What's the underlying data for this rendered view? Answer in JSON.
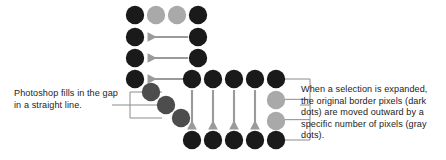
{
  "figure": {
    "name": "photoshop-expand-selection-diagram",
    "colors": {
      "dark_dot": "#1a1a1a",
      "light_gray_dot": "#a9a9a9",
      "mid_gray_dot": "#4d4d4d",
      "arrow": "#9a9a9a",
      "bracket": "#8c8c8c",
      "background": "#ffffff",
      "text": "#1c1c1c"
    }
  },
  "captions": {
    "left": {
      "text": "Photoshop fills in the gap in a straight line.",
      "lines": [
        "Photoshop fills in the",
        "gap in a straight line."
      ]
    },
    "right": {
      "text": "When a selection is expanded, the original border pixels (dark dots) are moved outward by a specific number of pixels (gray dots).",
      "lines": [
        "When a selection is expanded,",
        "the original border pixels",
        "(dark dots) are moved",
        "outward by a specific number",
        "of pixels (gray dots)."
      ]
    }
  },
  "chart_data": {
    "type": "diagram",
    "legend": [
      {
        "name": "original border pixel",
        "color": "#1a1a1a",
        "label": "dark dots"
      },
      {
        "name": "expanded pixel",
        "color": "#a9a9a9",
        "label": "gray dots"
      },
      {
        "name": "gap fill pixel",
        "color": "#4d4d4d",
        "label": "diagonal fill dots"
      }
    ],
    "dot_radius": 9.2,
    "dots": [
      {
        "id": "d1",
        "x": 135,
        "y": 15,
        "color": "#1a1a1a",
        "kind": "dark"
      },
      {
        "id": "d2",
        "x": 156,
        "y": 15,
        "color": "#a9a9a9",
        "kind": "light"
      },
      {
        "id": "d3",
        "x": 177,
        "y": 15,
        "color": "#a9a9a9",
        "kind": "light"
      },
      {
        "id": "d4",
        "x": 198,
        "y": 15,
        "color": "#1a1a1a",
        "kind": "dark"
      },
      {
        "id": "d5",
        "x": 135,
        "y": 37,
        "color": "#1a1a1a",
        "kind": "dark"
      },
      {
        "id": "d6",
        "x": 198,
        "y": 37,
        "color": "#1a1a1a",
        "kind": "dark"
      },
      {
        "id": "d7",
        "x": 135,
        "y": 58,
        "color": "#1a1a1a",
        "kind": "dark"
      },
      {
        "id": "d8",
        "x": 198,
        "y": 58,
        "color": "#1a1a1a",
        "kind": "dark"
      },
      {
        "id": "d9",
        "x": 135,
        "y": 79,
        "color": "#1a1a1a",
        "kind": "dark"
      },
      {
        "id": "g1",
        "x": 151,
        "y": 92,
        "color": "#4d4d4d",
        "kind": "mid"
      },
      {
        "id": "g2",
        "x": 166,
        "y": 105,
        "color": "#4d4d4d",
        "kind": "mid"
      },
      {
        "id": "g3",
        "x": 181,
        "y": 118,
        "color": "#4d4d4d",
        "kind": "mid"
      },
      {
        "id": "r1",
        "x": 192,
        "y": 79,
        "color": "#1a1a1a",
        "kind": "dark"
      },
      {
        "id": "r2",
        "x": 213,
        "y": 79,
        "color": "#1a1a1a",
        "kind": "dark"
      },
      {
        "id": "r3",
        "x": 234,
        "y": 79,
        "color": "#1a1a1a",
        "kind": "dark"
      },
      {
        "id": "r4",
        "x": 255,
        "y": 79,
        "color": "#1a1a1a",
        "kind": "dark"
      },
      {
        "id": "r5",
        "x": 276,
        "y": 79,
        "color": "#1a1a1a",
        "kind": "dark"
      },
      {
        "id": "c1",
        "x": 276,
        "y": 100,
        "color": "#a9a9a9",
        "kind": "light"
      },
      {
        "id": "c2",
        "x": 276,
        "y": 121,
        "color": "#a9a9a9",
        "kind": "light"
      },
      {
        "id": "b1",
        "x": 192,
        "y": 140,
        "color": "#1a1a1a",
        "kind": "dark"
      },
      {
        "id": "b2",
        "x": 213,
        "y": 140,
        "color": "#1a1a1a",
        "kind": "dark"
      },
      {
        "id": "b3",
        "x": 234,
        "y": 140,
        "color": "#1a1a1a",
        "kind": "dark"
      },
      {
        "id": "b4",
        "x": 255,
        "y": 140,
        "color": "#1a1a1a",
        "kind": "dark"
      },
      {
        "id": "b5",
        "x": 276,
        "y": 140,
        "color": "#1a1a1a",
        "kind": "dark"
      }
    ],
    "arrows": [
      {
        "id": "a1",
        "x1": 188,
        "y1": 37,
        "x2": 148,
        "y2": 37,
        "direction": "left"
      },
      {
        "id": "a2",
        "x1": 188,
        "y1": 58,
        "x2": 148,
        "y2": 58,
        "direction": "left"
      },
      {
        "id": "a3",
        "x1": 188,
        "y1": 79,
        "x2": 148,
        "y2": 79,
        "direction": "left"
      },
      {
        "id": "a4",
        "x1": 192,
        "y1": 90,
        "x2": 192,
        "y2": 129,
        "direction": "down"
      },
      {
        "id": "a5",
        "x1": 213,
        "y1": 90,
        "x2": 213,
        "y2": 129,
        "direction": "down"
      },
      {
        "id": "a6",
        "x1": 234,
        "y1": 90,
        "x2": 234,
        "y2": 129,
        "direction": "down"
      },
      {
        "id": "a7",
        "x1": 255,
        "y1": 90,
        "x2": 255,
        "y2": 129,
        "direction": "down"
      }
    ],
    "brackets": [
      {
        "id": "bracket-left",
        "side": "left",
        "prongs": 3,
        "spine_x": 130,
        "top": 92,
        "bottom": 118,
        "lead_x": 112,
        "lead_y": 105
      },
      {
        "id": "bracket-right",
        "side": "right",
        "prongs": 4,
        "spine_x": 310,
        "top": 79,
        "bottom": 140,
        "lead_x": 300,
        "lead_y": 105
      }
    ]
  }
}
